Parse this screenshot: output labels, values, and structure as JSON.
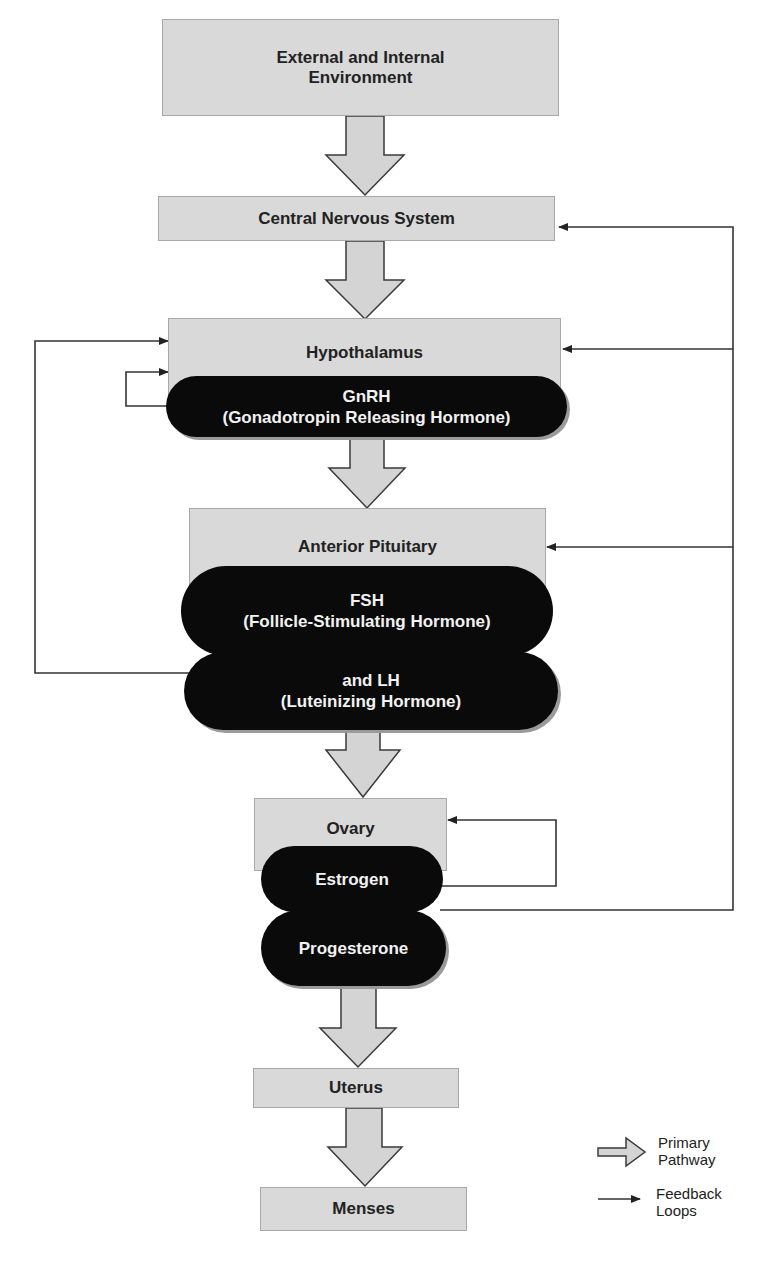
{
  "diagram": {
    "type": "flowchart",
    "colors": {
      "box_fill": "#d9d9d9",
      "hormone_fill": "#0a0a0a",
      "hormone_text": "#f2f2f2",
      "line": "#333333"
    },
    "nodes": {
      "environment": "External and Internal\nEnvironment",
      "cns": "Central Nervous System",
      "hypothalamus": "Hypothalamus",
      "gnrh": "GnRH\n(Gonadotropin Releasing Hormone)",
      "anterior_pituitary": "Anterior Pituitary",
      "fsh": "FSH\n(Follicle-Stimulating Hormone)",
      "lh": "and LH\n(Luteinizing Hormone)",
      "ovary": "Ovary",
      "estrogen": "Estrogen",
      "progesterone": "Progesterone",
      "uterus": "Uterus",
      "menses": "Menses"
    },
    "primary_pathway": [
      "External and Internal Environment",
      "Central Nervous System",
      "Hypothalamus",
      "Anterior Pituitary",
      "Ovary",
      "Uterus",
      "Menses"
    ],
    "feedback_loops": [
      {
        "from": "GnRH",
        "to": "Hypothalamus"
      },
      {
        "from": "FSH and LH",
        "to": "Hypothalamus"
      },
      {
        "from": "Estrogen",
        "to": "Ovary"
      },
      {
        "from": "Estrogen/Progesterone",
        "to": "Anterior Pituitary"
      },
      {
        "from": "Estrogen/Progesterone",
        "to": "Hypothalamus"
      },
      {
        "from": "Estrogen/Progesterone",
        "to": "Central Nervous System"
      }
    ],
    "legend": {
      "primary": "Primary\nPathway",
      "feedback": "Feedback\nLoops"
    }
  }
}
